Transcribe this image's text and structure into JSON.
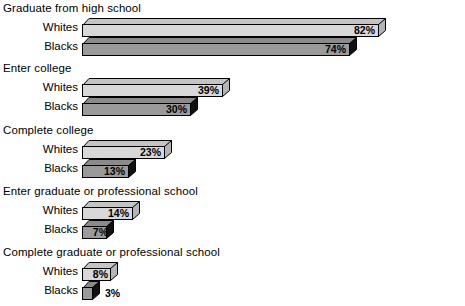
{
  "chart_data": {
    "type": "bar",
    "title": "",
    "subtitle": "",
    "xlabel": "",
    "ylabel": "",
    "xlim": [
      0,
      100
    ],
    "grid": false,
    "legend_position": "none",
    "orientation": "horizontal",
    "units": "%",
    "series": [
      {
        "name": "Whites",
        "values": [
          82,
          39,
          23,
          14,
          8
        ]
      },
      {
        "name": "Blacks",
        "values": [
          74,
          30,
          13,
          7,
          3
        ]
      }
    ],
    "categories": [
      "Graduate from high school",
      "Enter college",
      "Complete college",
      "Enter graduate or professional school",
      "Complete graduate or professional school"
    ],
    "groups": [
      {
        "title": "Graduate from high school",
        "bars": [
          {
            "label": "Whites",
            "value": 82,
            "value_label": "82%",
            "style": "whites",
            "label_placement": "inside"
          },
          {
            "label": "Blacks",
            "value": 74,
            "value_label": "74%",
            "style": "blacks",
            "label_placement": "inside"
          }
        ]
      },
      {
        "title": "Enter college",
        "bars": [
          {
            "label": "Whites",
            "value": 39,
            "value_label": "39%",
            "style": "whites",
            "label_placement": "inside"
          },
          {
            "label": "Blacks",
            "value": 30,
            "value_label": "30%",
            "style": "blacks",
            "label_placement": "inside"
          }
        ]
      },
      {
        "title": "Complete college",
        "bars": [
          {
            "label": "Whites",
            "value": 23,
            "value_label": "23%",
            "style": "whites",
            "label_placement": "inside"
          },
          {
            "label": "Blacks",
            "value": 13,
            "value_label": "13%",
            "style": "blacks",
            "label_placement": "inside"
          }
        ]
      },
      {
        "title": "Enter graduate or professional school",
        "bars": [
          {
            "label": "Whites",
            "value": 14,
            "value_label": "14%",
            "style": "whites",
            "label_placement": "inside"
          },
          {
            "label": "Blacks",
            "value": 7,
            "value_label": "7%",
            "style": "blacks",
            "label_placement": "inside"
          }
        ]
      },
      {
        "title": "Complete graduate or professional school",
        "bars": [
          {
            "label": "Whites",
            "value": 8,
            "value_label": "8%",
            "style": "whites",
            "label_placement": "inside"
          },
          {
            "label": "Blacks",
            "value": 3,
            "value_label": "3%",
            "style": "blacks",
            "label_placement": "outside"
          }
        ]
      }
    ],
    "colors": {
      "whites_face": "#d8d8d8",
      "whites_top": "#c4c4c4",
      "whites_side": "#b4b4b4",
      "blacks_face": "#9a9a9a",
      "blacks_top": "#8a8a8a",
      "blacks_side": "#111111",
      "outline": "#000000",
      "text": "#000000",
      "background": "#ffffff"
    }
  }
}
